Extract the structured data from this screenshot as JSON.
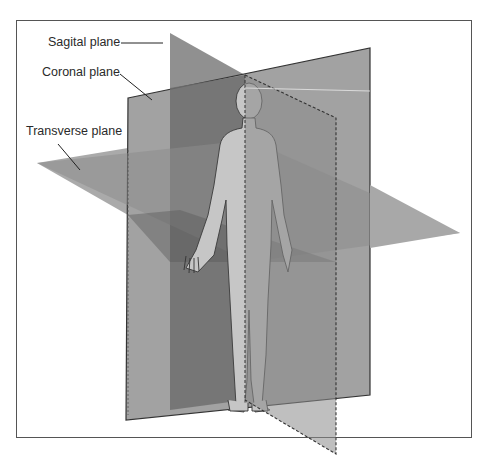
{
  "figure": {
    "labels": {
      "sagittal": "Sagital plane",
      "coronal": "Coronal plane",
      "transverse": "Transverse plane"
    },
    "colors": {
      "background": "#ffffff",
      "frame": "#555555",
      "coronal_plane": "#9a9a9a",
      "sagittal_plane": "#7c7c7c",
      "transverse_plane": "#a8a8a8",
      "body": "#c4c4c4",
      "text": "#2a2a2a"
    }
  }
}
